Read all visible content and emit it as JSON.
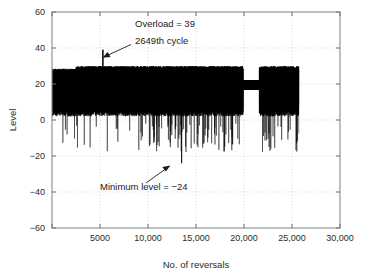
{
  "chart_data": {
    "type": "line",
    "title": "",
    "xlabel": "No. of reversals",
    "ylabel": "Level",
    "xlim": [
      0,
      30000
    ],
    "ylim": [
      -60,
      60
    ],
    "xticks": [
      0,
      5000,
      10000,
      15000,
      20000,
      25000,
      30000
    ],
    "xticklabels": [
      "",
      "5000",
      "10,000",
      "15,000",
      "20,000",
      "25,000",
      "30,000"
    ],
    "yticks": [
      -60,
      -40,
      -20,
      0,
      20,
      40,
      60
    ],
    "yticklabels": [
      "−60",
      "−40",
      "−20",
      "0",
      "20",
      "40",
      "60"
    ],
    "grid": true,
    "legend": "none",
    "series_name": "load level history",
    "series_color": "#000000",
    "data_extent_x": [
      0,
      25700
    ],
    "band_typical_high": 30,
    "band_typical_low": 2,
    "overload_peak_value": 39,
    "overload_peak_x": 5300,
    "minimum_value": -24,
    "minimum_x": 13500,
    "quiet_segment_x": [
      19900,
      21600
    ],
    "quiet_segment_range": [
      17,
      22
    ],
    "annotations": [
      {
        "name": "overload",
        "line1": "Overload = 39",
        "line2": "2649th cycle",
        "points_to_x": 5300,
        "points_to_y": 39
      },
      {
        "name": "minimum",
        "line1": "Minimum level = −24",
        "points_to_x": 13500,
        "points_to_y": -24
      }
    ]
  },
  "axes": {
    "x_title": "No. of reversals",
    "y_title": "Level",
    "x_tick_labels": [
      "5000",
      "10,000",
      "15,000",
      "20,000",
      "25,000",
      "30,000"
    ],
    "y_tick_labels": [
      "60",
      "40",
      "20",
      "0",
      "−20",
      "−40",
      "−60"
    ]
  },
  "annotations": {
    "overload_line1": "Overload = 39",
    "overload_line2": "2649th cycle",
    "minimum_label": "Minimum level = −24"
  },
  "colors": {
    "series": "#000000",
    "grid": "#c9c9c9",
    "axis": "#8a8a8a",
    "text": "#1a1a1a",
    "background": "#ffffff"
  }
}
